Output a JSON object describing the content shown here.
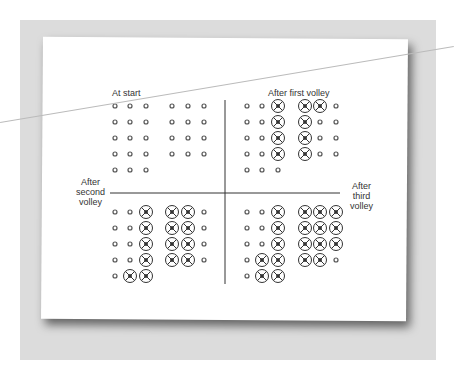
{
  "figure": {
    "labels": {
      "top_left": "At start",
      "top_right": "After first volley",
      "left_middle": "After\nsecond\nvolley",
      "right_middle": "After\nthird\nvolley"
    },
    "legend": {
      "o": "small circle (intact)",
      "X": "circled X (hit)"
    },
    "panels": [
      {
        "name": "at-start",
        "rows": [
          "ooo ooo",
          "ooo ooo",
          "ooo ooo",
          "ooo ooo",
          "ooo"
        ]
      },
      {
        "name": "after-first-volley",
        "rows": [
          "ooX XXo",
          "ooX Xoo",
          "ooX Xoo",
          "ooX Xoo",
          "ooo"
        ]
      },
      {
        "name": "after-second-volley",
        "rows": [
          "ooX XXo",
          "ooX XXo",
          "ooX XXo",
          "ooX XXo",
          "oXX"
        ]
      },
      {
        "name": "after-third-volley",
        "rows": [
          "ooX XXX",
          "ooX XXX",
          "ooX XXX",
          "oXX XXo",
          "oXX"
        ]
      }
    ]
  }
}
